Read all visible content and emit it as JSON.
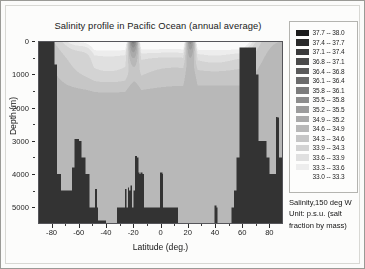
{
  "figure": {
    "title": "Salinity profile in Pacific Ocean (annual average)"
  },
  "axes": {
    "xlabel": "Latitude (deg.)",
    "ylabel": "Depth (m)",
    "xticks": [
      "-80",
      "-60",
      "-40",
      "-20",
      "0",
      "20",
      "40",
      "60",
      "80"
    ],
    "yticks": [
      "0",
      "1000",
      "2000",
      "3000",
      "4000",
      "5000"
    ]
  },
  "legend": {
    "rows": [
      {
        "label": "37.7 -- 38.0",
        "color": "#1c1c1c"
      },
      {
        "label": "37.4 -- 37.7",
        "color": "#2a2a2a"
      },
      {
        "label": "37.1 -- 37.4",
        "color": "#3a3a3a"
      },
      {
        "label": "36.8 -- 37.1",
        "color": "#4a4a4a"
      },
      {
        "label": "36.4 -- 36.8",
        "color": "#5a5a5a"
      },
      {
        "label": "36.1 -- 36.4",
        "color": "#6b6b6b"
      },
      {
        "label": "35.8 -- 36.1",
        "color": "#7c7c7c"
      },
      {
        "label": "35.5 -- 35.8",
        "color": "#8d8d8d"
      },
      {
        "label": "35.2 -- 35.5",
        "color": "#9c9c9c"
      },
      {
        "label": "34.9 -- 35.2",
        "color": "#aaaaaa"
      },
      {
        "label": "34.6 -- 34.9",
        "color": "#b8b8b8"
      },
      {
        "label": "34.3 -- 34.6",
        "color": "#c6c6c6"
      },
      {
        "label": "33.9 -- 34.3",
        "color": "#d3d3d3"
      },
      {
        "label": "33.6 -- 33.9",
        "color": "#e0e0e0"
      },
      {
        "label": "33.3 -- 33.6",
        "color": "#ededed"
      },
      {
        "label": "33.0 -- 33.3",
        "color": "#fafafa"
      }
    ]
  },
  "caption": {
    "line1": "Salinity,150 deg W",
    "line2": "Unit: p.s.u. (salt",
    "line3": "fraction by mass)"
  },
  "chart_data": {
    "type": "heatmap",
    "title": "Salinity profile in Pacific Ocean (annual average)",
    "xlabel": "Latitude (deg.)",
    "ylabel": "Depth (m)",
    "xlim": [
      -90,
      90
    ],
    "ylim": [
      5500,
      0
    ],
    "y_inverted": true,
    "grid": false,
    "legend_position": "right",
    "colorbar_label": "Salinity,150 deg W",
    "unit": "p.s.u. (salt fraction by mass)",
    "longitude": "150 deg W",
    "value_range": [
      33.0,
      38.0
    ],
    "colormap": "grayscale-inverted",
    "level_edges": [
      33.0,
      33.3,
      33.6,
      33.9,
      34.3,
      34.6,
      34.9,
      35.2,
      35.5,
      35.8,
      36.1,
      36.4,
      36.8,
      37.1,
      37.4,
      37.7,
      38.0
    ],
    "land_mask_color": "#333333",
    "bathymetry_note": "Dark mask marks seafloor and land; Antarctic shelf at left (<-78), Aleutian/Alaska margin at right (>57), mid-ocean ridge spikes near -60 and 0-20",
    "bathymetry_depth_m": [
      {
        "lat": -90,
        "depth": 0
      },
      {
        "lat": -85,
        "depth": 0
      },
      {
        "lat": -81,
        "depth": 0
      },
      {
        "lat": -78,
        "depth": 700
      },
      {
        "lat": -76,
        "depth": 4000
      },
      {
        "lat": -73,
        "depth": 4500
      },
      {
        "lat": -68,
        "depth": 4500
      },
      {
        "lat": -65,
        "depth": 3800
      },
      {
        "lat": -62,
        "depth": 3000
      },
      {
        "lat": -60,
        "depth": 3000
      },
      {
        "lat": -58,
        "depth": 3500
      },
      {
        "lat": -55,
        "depth": 4000
      },
      {
        "lat": -52,
        "depth": 5000
      },
      {
        "lat": -48,
        "depth": 5000
      },
      {
        "lat": -46,
        "depth": 5400
      },
      {
        "lat": -40,
        "depth": 5500
      },
      {
        "lat": -34,
        "depth": 5500
      },
      {
        "lat": -32,
        "depth": 5000
      },
      {
        "lat": -26,
        "depth": 5000
      },
      {
        "lat": -24,
        "depth": 4500
      },
      {
        "lat": -22,
        "depth": 5000
      },
      {
        "lat": -20,
        "depth": 4500
      },
      {
        "lat": -18,
        "depth": 3500
      },
      {
        "lat": -16,
        "depth": 4000
      },
      {
        "lat": -14,
        "depth": 4000
      },
      {
        "lat": -12,
        "depth": 5000
      },
      {
        "lat": -6,
        "depth": 5000
      },
      {
        "lat": -2,
        "depth": 5000
      },
      {
        "lat": 0,
        "depth": 4000
      },
      {
        "lat": 2,
        "depth": 5000
      },
      {
        "lat": 10,
        "depth": 5000
      },
      {
        "lat": 13,
        "depth": 5500
      },
      {
        "lat": 30,
        "depth": 5500
      },
      {
        "lat": 40,
        "depth": 5000
      },
      {
        "lat": 42,
        "depth": 5500
      },
      {
        "lat": 50,
        "depth": 5500
      },
      {
        "lat": 52,
        "depth": 5000
      },
      {
        "lat": 54,
        "depth": 4500
      },
      {
        "lat": 56,
        "depth": 3500
      },
      {
        "lat": 58,
        "depth": 200
      },
      {
        "lat": 66,
        "depth": 200
      },
      {
        "lat": 70,
        "depth": 1000
      },
      {
        "lat": 72,
        "depth": 3000
      },
      {
        "lat": 76,
        "depth": 3000
      },
      {
        "lat": 78,
        "depth": 3500
      },
      {
        "lat": 80,
        "depth": 4000
      },
      {
        "lat": 83,
        "depth": 4000
      },
      {
        "lat": 85,
        "depth": 2300
      },
      {
        "lat": 87,
        "depth": 3500
      },
      {
        "lat": 90,
        "depth": 3500
      }
    ],
    "water_mass_features": [
      {
        "name": "subtropical salinity maximum (south)",
        "lat_range": [
          -30,
          -10
        ],
        "depth_range": [
          0,
          300
        ],
        "salinity": 35.8
      },
      {
        "name": "subtropical salinity maximum (north)",
        "lat_range": [
          15,
          30
        ],
        "depth_range": [
          0,
          250
        ],
        "salinity": 35.5
      },
      {
        "name": "equatorial surface low",
        "lat_range": [
          -5,
          10
        ],
        "depth_range": [
          0,
          150
        ],
        "salinity": 34.6
      },
      {
        "name": "subpolar surface low (north)",
        "lat_range": [
          45,
          60
        ],
        "depth_range": [
          0,
          400
        ],
        "salinity": 33.3
      },
      {
        "name": "Antarctic surface low (south)",
        "lat_range": [
          -70,
          -50
        ],
        "depth_range": [
          0,
          300
        ],
        "salinity": 33.9
      },
      {
        "name": "Antarctic Intermediate Water",
        "lat_range": [
          -55,
          -20
        ],
        "depth_range": [
          600,
          1200
        ],
        "salinity": 34.3
      },
      {
        "name": "deep water",
        "lat_range": [
          -60,
          60
        ],
        "depth_range": [
          2000,
          5000
        ],
        "salinity": 34.7
      }
    ]
  }
}
